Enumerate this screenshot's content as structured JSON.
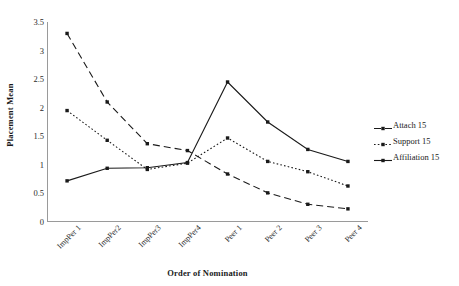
{
  "chart_data": {
    "type": "line",
    "title": "",
    "xlabel": "Order of Nomination",
    "ylabel": "Placement Mean",
    "categories": [
      "ImpPer 1",
      "ImpPer2",
      "ImpPer3",
      "ImpPer4",
      "Peer 1",
      "Peer 2",
      "Peer 3",
      "Peer 4"
    ],
    "ylim": [
      0,
      3.5
    ],
    "yticks": [
      "0",
      "0.5",
      "1",
      "1.5",
      "2",
      "2.5",
      "3",
      "3.5"
    ],
    "ytick_values": [
      0,
      0.5,
      1,
      1.5,
      2,
      2.5,
      3,
      3.5
    ],
    "grid": false,
    "legend_position": "right",
    "series": [
      {
        "name": "Attach 15",
        "style": "dashed",
        "color": "#1a1a1a",
        "marker": "square",
        "values": [
          3.3,
          2.1,
          1.37,
          1.25,
          0.84,
          0.51,
          0.31,
          0.23
        ]
      },
      {
        "name": "Support 15",
        "style": "dotted",
        "color": "#1a1a1a",
        "marker": "square",
        "values": [
          1.95,
          1.43,
          0.92,
          1.03,
          1.47,
          1.06,
          0.88,
          0.63
        ]
      },
      {
        "name": "Affiliation 15",
        "style": "solid",
        "color": "#1a1a1a",
        "marker": "square",
        "values": [
          0.72,
          0.94,
          0.95,
          1.04,
          2.45,
          1.75,
          1.27,
          1.06
        ]
      }
    ]
  },
  "legend": {
    "items": [
      {
        "label": "Attach 15"
      },
      {
        "label": "Support 15"
      },
      {
        "label": "Affiliation 15"
      }
    ]
  }
}
